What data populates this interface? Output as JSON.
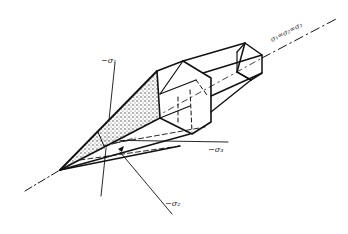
{
  "diagram": {
    "title": "",
    "labels": {
      "sigma1": "−σ₁",
      "sigma2": "−σ₂",
      "sigma3": "−σ₃",
      "hydrostatic_axis": "σ₁=σ₂=σ₃"
    },
    "colors": {
      "line": "#111111",
      "background": "#ffffff"
    }
  }
}
